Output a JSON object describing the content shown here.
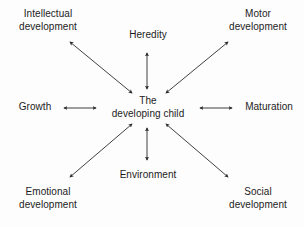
{
  "diagram": {
    "type": "radial-hub-and-spoke",
    "title": "The developing child",
    "background_color": "#fdfdfd",
    "text_color": "#1c1c1c",
    "arrow_color": "#2b2b2b",
    "center": {
      "id": "center",
      "label": "The\ndeveloping child"
    },
    "nodes": [
      {
        "id": "intellectual",
        "label": "Intellectual\ndevelopment",
        "position": "top-left"
      },
      {
        "id": "heredity",
        "label": "Heredity",
        "position": "top-center"
      },
      {
        "id": "motor",
        "label": "Motor\ndevelopment",
        "position": "top-right"
      },
      {
        "id": "growth",
        "label": "Growth",
        "position": "middle-left"
      },
      {
        "id": "maturation",
        "label": "Maturation",
        "position": "middle-right"
      },
      {
        "id": "emotional",
        "label": "Emotional\ndevelopment",
        "position": "bottom-left"
      },
      {
        "id": "environment",
        "label": "Environment",
        "position": "bottom-center"
      },
      {
        "id": "social",
        "label": "Social\ndevelopment",
        "position": "bottom-right"
      }
    ],
    "connections": [
      {
        "from": "center",
        "to": "intellectual",
        "style": "double-headed-arrow"
      },
      {
        "from": "center",
        "to": "heredity",
        "style": "double-headed-arrow"
      },
      {
        "from": "center",
        "to": "motor",
        "style": "double-headed-arrow"
      },
      {
        "from": "center",
        "to": "growth",
        "style": "double-headed-arrow"
      },
      {
        "from": "center",
        "to": "maturation",
        "style": "double-headed-arrow"
      },
      {
        "from": "center",
        "to": "emotional",
        "style": "double-headed-arrow"
      },
      {
        "from": "center",
        "to": "environment",
        "style": "double-headed-arrow"
      },
      {
        "from": "center",
        "to": "social",
        "style": "double-headed-arrow"
      }
    ]
  }
}
